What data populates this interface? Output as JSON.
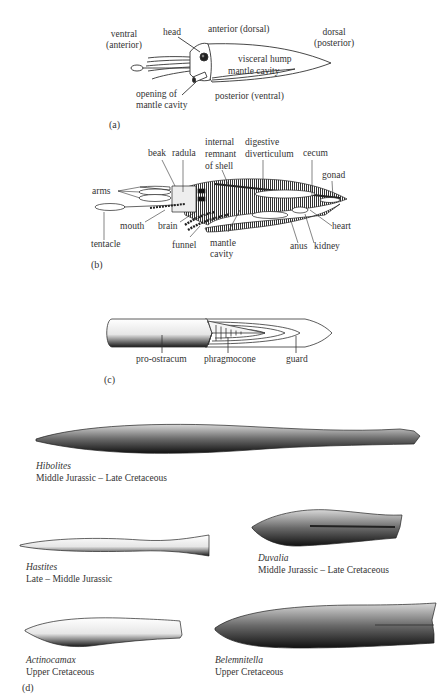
{
  "panel_a": {
    "letter": "(a)",
    "labels": {
      "ventral_line1": "ventral",
      "ventral_line2": "(anterior)",
      "head": "head",
      "anterior_dorsal": "anterior (dorsal)",
      "dorsal_line1": "dorsal",
      "dorsal_line2": "(posterior)",
      "visceral_hump": "visceral hump",
      "mantle_cavity": "mantle cavity",
      "opening_line1": "opening of",
      "opening_line2": "mantle cavity",
      "posterior_ventral": "posterior (ventral)"
    }
  },
  "panel_b": {
    "letter": "(b)",
    "labels": {
      "beak": "beak",
      "radula": "radula",
      "internal_line1": "internal",
      "internal_line2": "remnant",
      "internal_line3": "of shell",
      "digestive_line1": "digestive",
      "digestive_line2": "diverticulum",
      "cecum": "cecum",
      "gonad": "gonad",
      "arms": "arms",
      "heart": "heart",
      "tentacle": "tentacle",
      "mouth": "mouth",
      "brain": "brain",
      "funnel": "funnel",
      "mantle_line1": "mantle",
      "mantle_line2": "cavity",
      "anus": "anus",
      "kidney": "kidney"
    }
  },
  "panel_c": {
    "letter": "(c)",
    "labels": {
      "pro_ostracum": "pro-ostracum",
      "phragmocone": "phragmocone",
      "guard": "guard"
    }
  },
  "panel_d": {
    "letter": "(d)",
    "specimens": [
      {
        "genus": "Hibolites",
        "range": "Middle Jurassic – Late Cretaceous"
      },
      {
        "genus": "Hastites",
        "range": "Late – Middle Jurassic"
      },
      {
        "genus": "Duvalia",
        "range": "Middle Jurassic – Late Cretaceous"
      },
      {
        "genus": "Actinocamax",
        "range": "Upper Cretaceous"
      },
      {
        "genus": "Belemnitella",
        "range": "Upper Cretaceous"
      }
    ]
  }
}
